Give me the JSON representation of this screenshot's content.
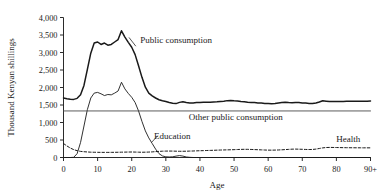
{
  "chart_data": {
    "type": "line",
    "title": "",
    "xlabel": "Age",
    "ylabel": "Thousand Kenyan shillings",
    "xlim": [
      0,
      90
    ],
    "ylim": [
      0,
      4000
    ],
    "grid": false,
    "legend_position": "inline-annotations",
    "xticks": [
      0,
      10,
      20,
      30,
      40,
      50,
      60,
      70,
      80,
      90
    ],
    "xtick_labels": [
      "0",
      "10",
      "20",
      "30",
      "40",
      "50",
      "60",
      "70",
      "80",
      "90+"
    ],
    "yticks": [
      0,
      500,
      1000,
      1500,
      2000,
      2500,
      3000,
      3500,
      4000
    ],
    "ytick_labels": [
      "0",
      "500",
      "1,000",
      "1,500",
      "2,000",
      "2,500",
      "3,000",
      "3,500",
      "4,000"
    ],
    "annotations": [
      {
        "name": "public-consumption-label",
        "text": "Public consumption",
        "x": 22.5,
        "y": 3260
      },
      {
        "name": "other-public-consumption-label",
        "text": "Other public consumption",
        "x": 50.5,
        "y": 1060
      },
      {
        "name": "education-label",
        "text": "Education",
        "x": 26.5,
        "y": 530
      },
      {
        "name": "health-label",
        "text": "Health",
        "x": 83.5,
        "y": 430
      }
    ],
    "series": [
      {
        "name": "Public consumption",
        "style": "solid",
        "width": 1.5,
        "color": "#1a1a1a",
        "x": [
          0,
          1,
          2,
          3,
          4,
          5,
          6,
          7,
          8,
          9,
          10,
          11,
          12,
          13,
          14,
          15,
          16,
          17,
          18,
          19,
          20,
          21,
          22,
          23,
          24,
          25,
          26,
          27,
          28,
          29,
          30,
          31,
          32,
          33,
          34,
          35,
          36,
          37,
          38,
          39,
          40,
          41,
          42,
          43,
          44,
          45,
          46,
          47,
          48,
          49,
          50,
          51,
          52,
          53,
          54,
          55,
          56,
          57,
          58,
          59,
          60,
          61,
          62,
          63,
          64,
          65,
          66,
          67,
          68,
          69,
          70,
          71,
          72,
          73,
          74,
          75,
          76,
          77,
          78,
          79,
          80,
          81,
          82,
          83,
          84,
          85,
          86,
          87,
          88,
          89,
          90
        ],
        "values": [
          1700,
          1680,
          1665,
          1660,
          1690,
          1790,
          2060,
          2520,
          2980,
          3270,
          3300,
          3230,
          3270,
          3210,
          3230,
          3300,
          3370,
          3620,
          3440,
          3290,
          3150,
          2940,
          2620,
          2290,
          2010,
          1840,
          1760,
          1700,
          1650,
          1620,
          1600,
          1570,
          1550,
          1540,
          1575,
          1590,
          1570,
          1560,
          1560,
          1570,
          1575,
          1580,
          1580,
          1580,
          1585,
          1590,
          1600,
          1610,
          1625,
          1630,
          1620,
          1615,
          1600,
          1590,
          1580,
          1575,
          1570,
          1560,
          1555,
          1545,
          1540,
          1535,
          1545,
          1560,
          1570,
          1580,
          1570,
          1565,
          1575,
          1570,
          1560,
          1555,
          1545,
          1540,
          1555,
          1585,
          1620,
          1610,
          1600,
          1598,
          1600,
          1600,
          1602,
          1605,
          1605,
          1605,
          1608,
          1608,
          1610,
          1610,
          1612
        ]
      },
      {
        "name": "Education",
        "style": "solid",
        "width": 0.9,
        "color": "#1a1a1a",
        "x": [
          0,
          1,
          2,
          3,
          4,
          5,
          6,
          7,
          8,
          9,
          10,
          11,
          12,
          13,
          14,
          15,
          16,
          17,
          18,
          19,
          20,
          21,
          22,
          23,
          24,
          25,
          26,
          27,
          28,
          29,
          30,
          31,
          32,
          33,
          34,
          35,
          36,
          37,
          38,
          39,
          40,
          41,
          42,
          43,
          44,
          45,
          46,
          47,
          48,
          49,
          50,
          51,
          52,
          53,
          54,
          55,
          56,
          57,
          58,
          59,
          60,
          61,
          62,
          63,
          64,
          65,
          66,
          67,
          68,
          69,
          70,
          71,
          72,
          73,
          74,
          75,
          76,
          77,
          78,
          79,
          80,
          81,
          82,
          83,
          84,
          85,
          86,
          87,
          88,
          89,
          90
        ],
        "values": [
          0,
          0,
          0,
          5,
          110,
          430,
          900,
          1370,
          1700,
          1840,
          1860,
          1820,
          1770,
          1800,
          1790,
          1840,
          1900,
          2150,
          1960,
          1830,
          1720,
          1570,
          1330,
          1030,
          760,
          560,
          400,
          240,
          110,
          45,
          20,
          15,
          20,
          40,
          55,
          40,
          15,
          5,
          0,
          0,
          0,
          0,
          0,
          0,
          0,
          0,
          0,
          0,
          0,
          0,
          0,
          0,
          0,
          0,
          0,
          0,
          0,
          0,
          0,
          0,
          0,
          0,
          0,
          0,
          0,
          0,
          0,
          0,
          0,
          0,
          0,
          0,
          0,
          0,
          0,
          0,
          0,
          0,
          0,
          0,
          0,
          0,
          0,
          0,
          0,
          0,
          0,
          0,
          0,
          0,
          0
        ]
      },
      {
        "name": "Other public consumption",
        "style": "solid",
        "width": 0.9,
        "color": "#4a4a4a",
        "x": [
          0,
          90
        ],
        "values": [
          1330,
          1330
        ]
      },
      {
        "name": "Health",
        "style": "dashed",
        "width": 1.0,
        "color": "#1a1a1a",
        "x": [
          0,
          1,
          2,
          3,
          4,
          5,
          6,
          7,
          8,
          9,
          10,
          11,
          12,
          13,
          14,
          15,
          16,
          17,
          18,
          19,
          20,
          21,
          22,
          23,
          24,
          25,
          26,
          27,
          28,
          29,
          30,
          31,
          32,
          33,
          34,
          35,
          36,
          37,
          38,
          39,
          40,
          41,
          42,
          43,
          44,
          45,
          46,
          47,
          48,
          49,
          50,
          51,
          52,
          53,
          54,
          55,
          56,
          57,
          58,
          59,
          60,
          61,
          62,
          63,
          64,
          65,
          66,
          67,
          68,
          69,
          70,
          71,
          72,
          73,
          74,
          75,
          76,
          77,
          78,
          79,
          80,
          81,
          82,
          83,
          84,
          85,
          86,
          87,
          88,
          89,
          90
        ],
        "values": [
          400,
          330,
          270,
          225,
          195,
          175,
          165,
          158,
          152,
          150,
          148,
          147,
          146,
          146,
          147,
          148,
          150,
          152,
          154,
          156,
          157,
          155,
          152,
          150,
          152,
          155,
          160,
          168,
          175,
          180,
          183,
          184,
          183,
          180,
          178,
          178,
          180,
          183,
          186,
          190,
          193,
          196,
          200,
          203,
          206,
          210,
          213,
          216,
          218,
          221,
          224,
          228,
          232,
          234,
          233,
          230,
          226,
          222,
          218,
          214,
          211,
          210,
          212,
          215,
          220,
          226,
          232,
          238,
          240,
          238,
          234,
          230,
          228,
          230,
          240,
          258,
          275,
          285,
          288,
          287,
          285,
          283,
          281,
          280,
          279,
          278,
          277,
          277,
          276,
          276,
          276
        ]
      }
    ]
  }
}
